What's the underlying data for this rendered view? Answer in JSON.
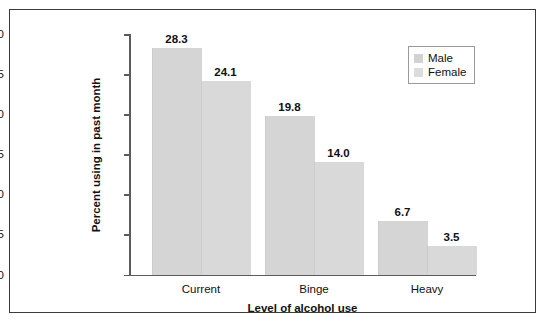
{
  "chart_data": {
    "type": "bar",
    "title": "",
    "subtitle": "",
    "xlabel": "Level of alcohol use",
    "ylabel": "Percent using in past month",
    "categories": [
      "Current",
      "Binge",
      "Heavy"
    ],
    "series": [
      {
        "name": "Male",
        "values": [
          28.3,
          19.8,
          6.7
        ],
        "color": "#d5d5d5"
      },
      {
        "name": "Female",
        "values": [
          24.1,
          14.0,
          3.5
        ],
        "color": "#d9d9d9"
      }
    ],
    "value_labels": [
      [
        "28.3",
        "24.1"
      ],
      [
        "19.8",
        "14.0"
      ],
      [
        "6.7",
        "3.5"
      ]
    ],
    "ylim": [
      0,
      30
    ],
    "ytick_labels": [
      "0",
      "5",
      "10",
      "15",
      "20",
      "25",
      "30"
    ],
    "ytick_values": [
      0,
      5,
      10,
      15,
      20,
      25,
      30
    ],
    "grid": false,
    "legend_position": "top-right"
  },
  "legend": {
    "items": [
      {
        "label": "Male",
        "swatch_color": "#d2d2d2"
      },
      {
        "label": "Female",
        "swatch_color": "#dcdcdc"
      }
    ]
  },
  "frame": {
    "border_color": "#3a3a3a",
    "axis_color": "#5b5b5b",
    "background": "#ffffff"
  }
}
